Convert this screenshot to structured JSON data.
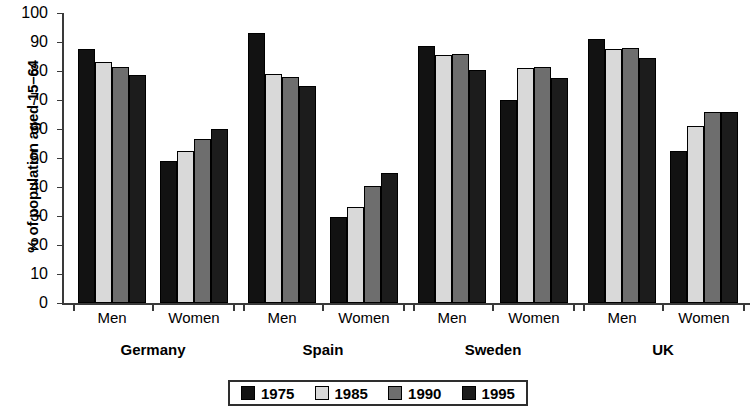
{
  "chart_data": {
    "type": "bar",
    "title": "",
    "xlabel": "",
    "ylabel": "% of population aged 15–64",
    "ylim": [
      0,
      100
    ],
    "ytick_labels": [
      "100",
      "90",
      "80",
      "70",
      "60",
      "50",
      "40",
      "30",
      "20",
      "10",
      "0"
    ],
    "ytick_values": [
      100,
      90,
      80,
      70,
      60,
      50,
      40,
      30,
      20,
      10,
      0
    ],
    "grid": false,
    "legend_position": "bottom-center",
    "categories": [
      "Germany Men",
      "Germany Women",
      "Spain Men",
      "Spain Women",
      "Sweden Men",
      "Sweden Women",
      "UK Men",
      "UK Women"
    ],
    "series": [
      {
        "name": "1975",
        "color": "#121212",
        "values": [
          87.5,
          49,
          93,
          29.5,
          88.5,
          70,
          91,
          52.5
        ]
      },
      {
        "name": "1985",
        "color": "#d9d9d9",
        "values": [
          83,
          52.5,
          79,
          33,
          85.5,
          81,
          87.5,
          61
        ]
      },
      {
        "name": "1990",
        "color": "#6e6e6e",
        "values": [
          81.5,
          56.5,
          78,
          40.5,
          86,
          81.5,
          88,
          66
        ]
      },
      {
        "name": "1995",
        "color": "#1c1c1c",
        "values": [
          78.5,
          60,
          75,
          45,
          80.5,
          77.5,
          84.5,
          66
        ]
      }
    ],
    "groups": [
      {
        "country": "Germany",
        "subgroups": [
          {
            "sex": "Men",
            "bars": [
              {
                "year": "1975",
                "value": 87.5
              },
              {
                "year": "1985",
                "value": 83
              },
              {
                "year": "1990",
                "value": 81.5
              },
              {
                "year": "1995",
                "value": 78.5
              }
            ]
          },
          {
            "sex": "Women",
            "bars": [
              {
                "year": "1975",
                "value": 49
              },
              {
                "year": "1985",
                "value": 52.5
              },
              {
                "year": "1990",
                "value": 56.5
              },
              {
                "year": "1995",
                "value": 60
              }
            ]
          }
        ]
      },
      {
        "country": "Spain",
        "subgroups": [
          {
            "sex": "Men",
            "bars": [
              {
                "year": "1975",
                "value": 93
              },
              {
                "year": "1985",
                "value": 79
              },
              {
                "year": "1990",
                "value": 78
              },
              {
                "year": "1995",
                "value": 75
              }
            ]
          },
          {
            "sex": "Women",
            "bars": [
              {
                "year": "1975",
                "value": 29.5
              },
              {
                "year": "1985",
                "value": 33
              },
              {
                "year": "1990",
                "value": 40.5
              },
              {
                "year": "1995",
                "value": 45
              }
            ]
          }
        ]
      },
      {
        "country": "Sweden",
        "subgroups": [
          {
            "sex": "Men",
            "bars": [
              {
                "year": "1975",
                "value": 88.5
              },
              {
                "year": "1985",
                "value": 85.5
              },
              {
                "year": "1990",
                "value": 86
              },
              {
                "year": "1995",
                "value": 80.5
              }
            ]
          },
          {
            "sex": "Women",
            "bars": [
              {
                "year": "1975",
                "value": 70
              },
              {
                "year": "1985",
                "value": 81
              },
              {
                "year": "1990",
                "value": 81.5
              },
              {
                "year": "1995",
                "value": 77.5
              }
            ]
          }
        ]
      },
      {
        "country": "UK",
        "subgroups": [
          {
            "sex": "Men",
            "bars": [
              {
                "year": "1975",
                "value": 91
              },
              {
                "year": "1985",
                "value": 87.5
              },
              {
                "year": "1990",
                "value": 88
              },
              {
                "year": "1995",
                "value": 84.5
              }
            ]
          },
          {
            "sex": "Women",
            "bars": [
              {
                "year": "1975",
                "value": 52.5
              },
              {
                "year": "1985",
                "value": 61
              },
              {
                "year": "1990",
                "value": 66
              },
              {
                "year": "1995",
                "value": 66
              }
            ]
          }
        ]
      }
    ],
    "legend": [
      {
        "label": "1975",
        "color": "#121212"
      },
      {
        "label": "1985",
        "color": "#d9d9d9"
      },
      {
        "label": "1990",
        "color": "#6e6e6e"
      },
      {
        "label": "1995",
        "color": "#1c1c1c"
      }
    ]
  }
}
